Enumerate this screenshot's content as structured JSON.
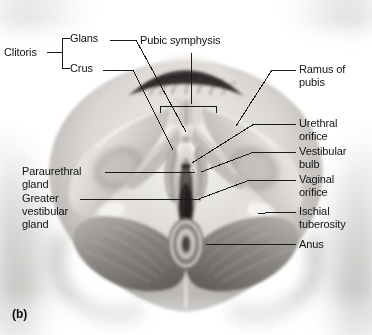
{
  "figure": {
    "panel_letter": "(b)",
    "type": "anatomical-illustration",
    "style": "grayscale medical illustration"
  },
  "labels": {
    "clitoris": "Clitoris",
    "glans": "Glans",
    "crus": "Crus",
    "pubic_symphysis": "Pubic symphysis",
    "ramus_of_pubis_line1": "Ramus of",
    "ramus_of_pubis_line2": "pubis",
    "urethral_orifice_line1": "Urethral",
    "urethral_orifice_line2": "orifice",
    "vestibular_bulb_line1": "Vestibular",
    "vestibular_bulb_line2": "bulb",
    "vaginal_orifice_line1": "Vaginal",
    "vaginal_orifice_line2": "orifice",
    "ischial_tuberosity_line1": "Ischial",
    "ischial_tuberosity_line2": "tuberosity",
    "anus": "Anus",
    "paraurethral_gland_line1": "Paraurethral",
    "paraurethral_gland_line2": "gland",
    "greater_vestibular_gland_line1": "Greater",
    "greater_vestibular_gland_line2": "vestibular",
    "greater_vestibular_gland_line3": "gland"
  },
  "colors": {
    "background": "#ffffff",
    "text": "#111111",
    "leader_line": "#1a1a1a",
    "skin_light": "#f0eeec",
    "skin_mid": "#c9c6c3",
    "skin_dark": "#8e8b88",
    "bone_light": "#efeeec",
    "bone_mid": "#cbc8c4",
    "muscle_mid": "#9b9894",
    "muscle_dark": "#5f5c59",
    "cavity_dark": "#2a2826"
  }
}
